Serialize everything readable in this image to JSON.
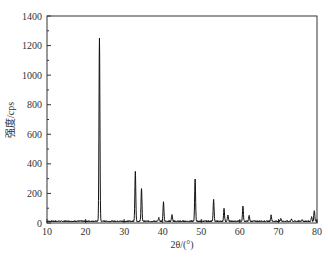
{
  "chart_data": {
    "type": "line",
    "title": "",
    "xlabel": "2θ/(°)",
    "ylabel": "强度/cps",
    "xlim": [
      10,
      80
    ],
    "ylim": [
      0,
      1400
    ],
    "xticks": [
      10,
      20,
      30,
      40,
      50,
      60,
      70,
      80
    ],
    "yticks": [
      0,
      200,
      400,
      600,
      800,
      1000,
      1200,
      1400
    ],
    "grid": false,
    "legend": null,
    "baseline": 12,
    "peaks": [
      {
        "x": 23.6,
        "y": 1240
      },
      {
        "x": 32.9,
        "y": 335
      },
      {
        "x": 34.5,
        "y": 220
      },
      {
        "x": 39.0,
        "y": 22
      },
      {
        "x": 40.2,
        "y": 130
      },
      {
        "x": 42.4,
        "y": 45
      },
      {
        "x": 48.4,
        "y": 285
      },
      {
        "x": 53.2,
        "y": 145
      },
      {
        "x": 55.9,
        "y": 85
      },
      {
        "x": 56.9,
        "y": 40
      },
      {
        "x": 60.8,
        "y": 100
      },
      {
        "x": 62.4,
        "y": 40
      },
      {
        "x": 68.1,
        "y": 40
      },
      {
        "x": 70.6,
        "y": 18
      },
      {
        "x": 73.4,
        "y": 12
      },
      {
        "x": 76.1,
        "y": 12
      },
      {
        "x": 78.6,
        "y": 30
      },
      {
        "x": 79.3,
        "y": 75
      }
    ]
  },
  "plot_area": {
    "left": 47,
    "top": 16,
    "right": 317,
    "bottom": 223
  },
  "colors": {
    "line": "#111111",
    "axis": "#333333"
  }
}
